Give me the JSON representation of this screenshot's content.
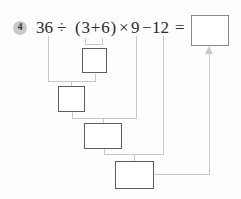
{
  "problem": {
    "number": "4",
    "expression": "36÷(3+6)×9−12=",
    "tokens": [
      "36",
      "÷",
      "(3+6)",
      "×",
      "9",
      "−",
      "12",
      "="
    ]
  },
  "diagram": {
    "step_boxes": [
      {
        "name": "step-1-box",
        "value": "",
        "purpose": "result of (3+6)"
      },
      {
        "name": "step-2-box",
        "value": "",
        "purpose": "result of 36÷step1"
      },
      {
        "name": "step-3-box",
        "value": "",
        "purpose": "result of step2×9"
      },
      {
        "name": "step-4-box",
        "value": "",
        "purpose": "result of step3−12"
      }
    ],
    "result_box": {
      "name": "result-box",
      "value": ""
    },
    "arrow": "up-arrow-into-result-box"
  },
  "colors": {
    "background": "#fdfdfd",
    "badge_bg": "#c9c9c9",
    "badge_text": "#333333",
    "expression_text": "#2b2b2b",
    "step_box_border": "#5d5d5d",
    "result_box_border": "#898989",
    "connector_line": "#c9c9c9"
  }
}
